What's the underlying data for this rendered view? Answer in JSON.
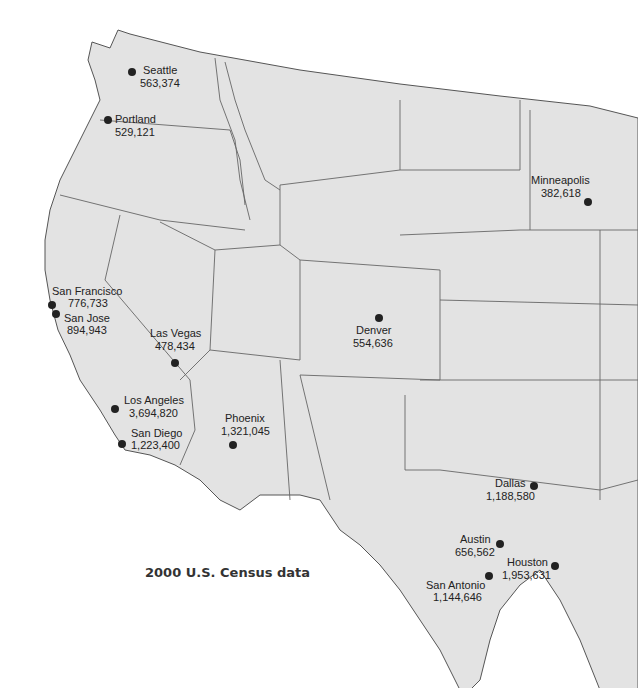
{
  "map": {
    "caption": "2000 U.S. Census data",
    "colors": {
      "land": "#e3e3e3",
      "border": "#666666",
      "dot": "#222222",
      "background": "#ffffff"
    },
    "cities": [
      {
        "name": "Seattle",
        "population": "563,374"
      },
      {
        "name": "Portland",
        "population": "529,121"
      },
      {
        "name": "Minneapolis",
        "population": "382,618"
      },
      {
        "name": "San Francisco",
        "population": "776,733"
      },
      {
        "name": "San Jose",
        "population": "894,943"
      },
      {
        "name": "Las Vegas",
        "population": "478,434"
      },
      {
        "name": "Denver",
        "population": "554,636"
      },
      {
        "name": "Los Angeles",
        "population": "3,694,820"
      },
      {
        "name": "San Diego",
        "population": "1,223,400"
      },
      {
        "name": "Phoenix",
        "population": "1,321,045"
      },
      {
        "name": "Dallas",
        "population": "1,188,580"
      },
      {
        "name": "Austin",
        "population": "656,562"
      },
      {
        "name": "Houston",
        "population": "1,953,631"
      },
      {
        "name": "San Antonio",
        "population": "1,144,646"
      }
    ]
  }
}
